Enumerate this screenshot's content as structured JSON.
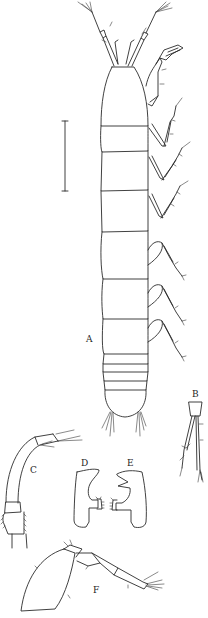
{
  "figure": {
    "type": "scientific-illustration",
    "panels": [
      {
        "id": "A",
        "label": "A",
        "description": "whole animal, dorsal view"
      },
      {
        "id": "B",
        "label": "B",
        "description": "uropod"
      },
      {
        "id": "C",
        "label": "C",
        "description": "antenna / antennule"
      },
      {
        "id": "D",
        "label": "D",
        "description": "left mandible"
      },
      {
        "id": "E",
        "label": "E",
        "description": "right mandible"
      },
      {
        "id": "F",
        "label": "F",
        "description": "pereopod"
      }
    ],
    "scale_bar": {
      "label": ""
    },
    "colors": {
      "ink": "#2b2b2b",
      "paper": "#ffffff"
    }
  }
}
